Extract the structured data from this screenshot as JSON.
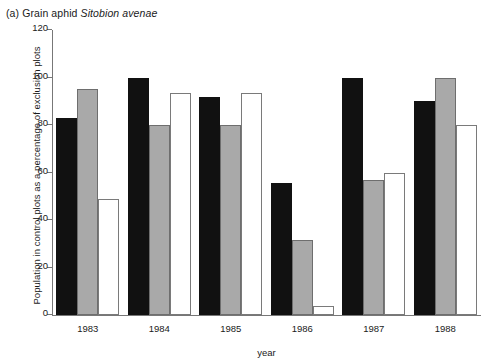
{
  "chart_data": {
    "type": "bar",
    "title": "(a) Grain aphid Sitobion avenae",
    "title_prefix": "(a) Grain aphid ",
    "title_species": "Sitobion avenae",
    "xlabel": "year",
    "ylabel": "Population in control plots as a percentage of exclusion plots",
    "categories": [
      "1983",
      "1984",
      "1985",
      "1986",
      "1987",
      "1988"
    ],
    "ylim": [
      0,
      120
    ],
    "yticks": [
      0,
      20,
      40,
      60,
      80,
      100,
      120
    ],
    "ytick_labels": [
      "0",
      "20",
      "40",
      "60",
      "80",
      "100",
      "120"
    ],
    "grid": false,
    "legend": "none",
    "series": [
      {
        "name": "series-1",
        "color": "#111111",
        "fill": "black",
        "values": [
          83,
          100,
          92,
          55.5,
          100,
          90
        ]
      },
      {
        "name": "series-2",
        "color": "#a9a9a9",
        "fill": "gray",
        "values": [
          95,
          80,
          80,
          31.5,
          57,
          100
        ]
      },
      {
        "name": "series-3",
        "color": "#ffffff",
        "fill": "white",
        "values": [
          49,
          93.5,
          93.5,
          4,
          60,
          80
        ]
      }
    ]
  },
  "colors": {
    "black": "#111111",
    "gray": "#a9a9a9",
    "gray_outline": "#6e6e6e",
    "white": "#ffffff",
    "white_outline": "#7a7a7a",
    "axis": "#777777",
    "text": "#1a1a1a",
    "background": "#ffffff"
  }
}
